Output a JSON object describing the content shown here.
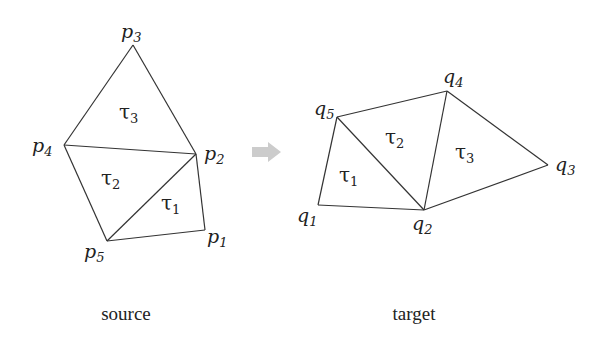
{
  "source": {
    "caption": "source",
    "vertices": [
      {
        "name": "p",
        "sub": "1",
        "x": 205,
        "y": 230
      },
      {
        "name": "p",
        "sub": "2",
        "x": 196,
        "y": 154
      },
      {
        "name": "p",
        "sub": "3",
        "x": 133,
        "y": 45
      },
      {
        "name": "p",
        "sub": "4",
        "x": 64,
        "y": 145
      },
      {
        "name": "p",
        "sub": "5",
        "x": 107,
        "y": 241
      }
    ],
    "triangles": [
      {
        "label": "τ",
        "sub": "1"
      },
      {
        "label": "τ",
        "sub": "2"
      },
      {
        "label": "τ",
        "sub": "3"
      }
    ]
  },
  "target": {
    "caption": "target",
    "vertices": [
      {
        "name": "q",
        "sub": "1",
        "x": 318,
        "y": 205
      },
      {
        "name": "q",
        "sub": "2",
        "x": 424,
        "y": 210
      },
      {
        "name": "q",
        "sub": "3",
        "x": 548,
        "y": 165
      },
      {
        "name": "q",
        "sub": "4",
        "x": 447,
        "y": 91
      },
      {
        "name": "q",
        "sub": "5",
        "x": 337,
        "y": 117
      }
    ],
    "triangles": [
      {
        "label": "τ",
        "sub": "1"
      },
      {
        "label": "τ",
        "sub": "2"
      },
      {
        "label": "τ",
        "sub": "3"
      }
    ]
  },
  "arrow": {
    "color": "#cccccc",
    "direction": "right"
  }
}
